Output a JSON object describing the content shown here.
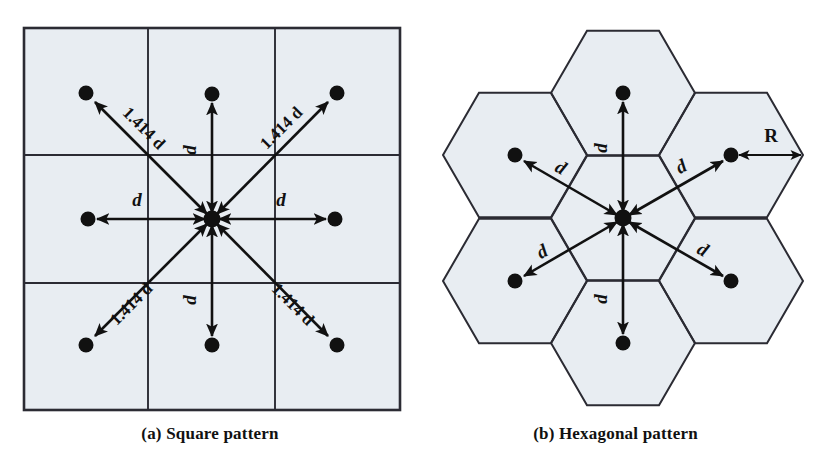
{
  "figure": {
    "background_color": "#ffffff",
    "cell_fill_color": "#e8edf2",
    "cell_stroke_color": "#2b2b33",
    "marker_color": "#111111"
  },
  "panels": [
    {
      "id": "a",
      "caption": "(a) Square pattern",
      "shape": "square",
      "grid": {
        "rows": 3,
        "cols": 3
      },
      "center_node": {
        "label": "center",
        "x": 212,
        "y": 219
      },
      "neighbors": [
        {
          "direction": "north",
          "label": "d",
          "distance_text": "d",
          "x": 212,
          "y": 94
        },
        {
          "direction": "south",
          "label": "d",
          "distance_text": "d",
          "x": 212,
          "y": 345
        },
        {
          "direction": "east",
          "label": "d",
          "distance_text": "d",
          "x": 335,
          "y": 219
        },
        {
          "direction": "west",
          "label": "d",
          "distance_text": "d",
          "x": 88,
          "y": 219
        },
        {
          "direction": "northwest",
          "label": "1.414 d",
          "distance_text": "1.414 d",
          "x": 86,
          "y": 93
        },
        {
          "direction": "northeast",
          "label": "1.414 d",
          "distance_text": "1.414 d",
          "x": 337,
          "y": 93
        },
        {
          "direction": "southwest",
          "label": "1.414 d",
          "distance_text": "1.414 d",
          "x": 86,
          "y": 345
        },
        {
          "direction": "southeast",
          "label": "1.414 d",
          "distance_text": "1.414 d",
          "x": 337,
          "y": 345
        }
      ]
    },
    {
      "id": "b",
      "caption": "(b) Hexagonal pattern",
      "shape": "hexagon",
      "cell_count": 7,
      "radius_label": "R",
      "center_node": {
        "label": "center",
        "x": 623,
        "y": 218
      },
      "neighbors": [
        {
          "direction": "north",
          "label": "d",
          "distance_text": "d",
          "x": 623,
          "y": 93
        },
        {
          "direction": "northeast",
          "label": "d",
          "distance_text": "d",
          "x": 731,
          "y": 155
        },
        {
          "direction": "southeast",
          "label": "d",
          "distance_text": "d",
          "x": 731,
          "y": 281
        },
        {
          "direction": "south",
          "label": "d",
          "distance_text": "d",
          "x": 623,
          "y": 343
        },
        {
          "direction": "southwest",
          "label": "d",
          "distance_text": "d",
          "x": 515,
          "y": 281
        },
        {
          "direction": "northwest",
          "label": "d",
          "distance_text": "d",
          "x": 515,
          "y": 155
        }
      ]
    }
  ],
  "labels": {
    "d": "d",
    "sqrt2d": "1.414 d",
    "R": "R"
  }
}
